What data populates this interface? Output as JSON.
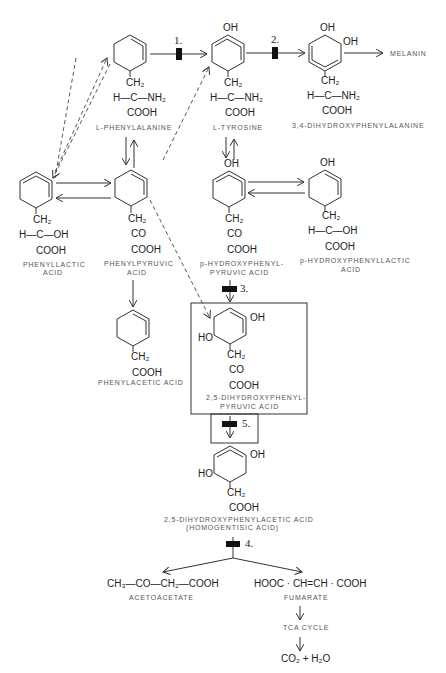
{
  "diagram": {
    "compounds": {
      "phenylalanine": {
        "group1": "CH₂",
        "group2": "H—C—NH₂",
        "group3": "COOH",
        "label": "L-PHENYLALANINE"
      },
      "tyrosine": {
        "top": "OH",
        "group1": "CH₂",
        "group2": "H—C—NH₂",
        "group3": "COOH",
        "label": "L-TYROSINE"
      },
      "dopa": {
        "top": "OH",
        "side": "OH",
        "group1": "CH₂",
        "group2": "H—C—NH₂",
        "group3": "COOH",
        "label": "3,4-DIHYDROXYPHENYLALANINE"
      },
      "melanin": {
        "label": "MELANIN"
      },
      "phenyllactic": {
        "group1": "CH₂",
        "group2": "H—C—OH",
        "group3": "COOH",
        "label1": "PHENYLLACTIC",
        "label2": "ACID"
      },
      "phenylpyruvic": {
        "group1": "CH₂",
        "group2": "CO",
        "group3": "COOH",
        "label1": "PHENYLPYRUVIC",
        "label2": "ACID"
      },
      "hydroxyphenylpyruvic": {
        "top": "OH",
        "group1": "CH₂",
        "group2": "CO",
        "group3": "COOH",
        "label1": "p-HYDROXYPHENYL-",
        "label2": "PYRUVIC ACID"
      },
      "hydroxyphenyllactic": {
        "top": "OH",
        "group1": "CH₂",
        "group2": "H—C—OH",
        "group3": "COOH",
        "label1": "p-HYDROXYPHENYLLACTIC",
        "label2": "ACID"
      },
      "phenylacetic": {
        "group1": "CH₂",
        "group2": "COOH",
        "label": "PHENYLACETIC ACID"
      },
      "dihydroxyphenylpyruvic": {
        "oh": "OH",
        "ho": "HO",
        "group1": "CH₂",
        "group2": "CO",
        "group3": "COOH",
        "label1": "2,5-DIHYDROXYPHENYL-",
        "label2": "PYRUVIC ACID"
      },
      "homogentisic": {
        "oh": "OH",
        "ho": "HO",
        "group1": "CH₂",
        "group2": "COOH",
        "label1": "2,5-DIHYDROXYPHENYLACETIC ACID",
        "label2": "(HOMOGENTISIC ACID)"
      },
      "acetoacetate": {
        "formula": "CH₃—CO—CH₂—COOH",
        "label": "ACETOACETATE"
      },
      "fumarate": {
        "formula": "HOOC · CH=CH · COOH",
        "label": "FUMARATE"
      },
      "tca": {
        "label": "TCA CYCLE"
      },
      "products": {
        "formula": "CO₂ + H₂O"
      }
    },
    "blocks": {
      "b1": "1.",
      "b2": "2.",
      "b3": "3.",
      "b4": "4.",
      "b5": "5."
    }
  }
}
